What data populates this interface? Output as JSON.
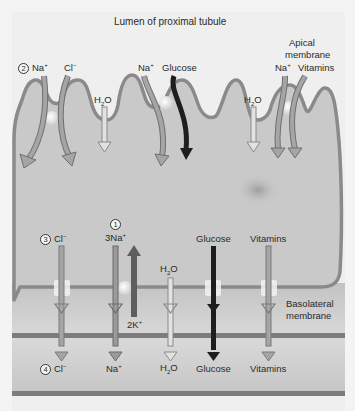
{
  "title": "Lumen of proximal tubule",
  "membranes": {
    "apical": "Apical membrane",
    "apical_line1": "Apical",
    "apical_line2": "membrane",
    "basolateral_line1": "Basolateral",
    "basolateral_line2": "membrane"
  },
  "steps": {
    "one": "1",
    "two": "2",
    "three": "3",
    "four": "4"
  },
  "apical_labels": {
    "na1": "Na",
    "cl": "Cl",
    "h2o_1": "H",
    "na2": "Na",
    "glucose": "Glucose",
    "h2o_2": "H",
    "na3": "Na",
    "vitamins": "Vitamins"
  },
  "basolateral_labels": {
    "cl": "Cl",
    "na3": "3Na",
    "h2o": "H",
    "glucose": "Glucose",
    "vitamins": "Vitamins",
    "k2": "2K"
  },
  "interstitial_labels": {
    "cl": "Cl",
    "na": "Na",
    "h2o": "H",
    "glucose": "Glucose",
    "vitamins": "Vitamins"
  },
  "glyphs": {
    "plus": "+",
    "minus": "−",
    "two": "2",
    "o": "O"
  },
  "colors": {
    "background": "#f4f4f4",
    "cell_fill": "#c9c9c9",
    "membrane": "#8a8a8a",
    "interstitium": "#cfcfcf",
    "capillary_wall": "#7d7d7d",
    "ion_arrow": "#9a9a9a",
    "water_arrow": "#dcdcdc",
    "glucose_arrow": "#1e1e1e",
    "pump_arrow": "#5e5e5e"
  }
}
